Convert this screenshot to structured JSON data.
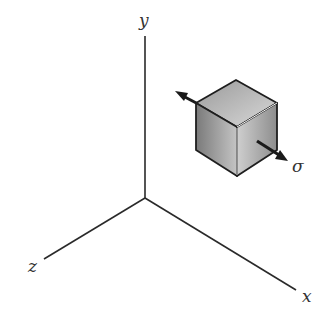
{
  "diagram": {
    "type": "3d-axes-with-stress-element",
    "axes": {
      "y_label": "y",
      "x_label": "x",
      "z_label": "z"
    },
    "element": {
      "shape": "cube",
      "stress_label": "σ"
    },
    "colors": {
      "line": "#2a2a2a",
      "cube_top": "#bdbdbd",
      "cube_left": "#8f8f8f",
      "cube_right": "#b0b0b0"
    }
  }
}
